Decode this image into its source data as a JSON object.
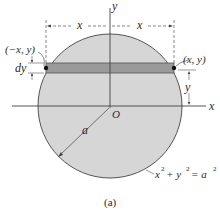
{
  "figure": {
    "caption": "(a)",
    "labels": {
      "y_axis": "y",
      "x_axis": "x",
      "origin": "O",
      "radius": "a",
      "left_dim": "x",
      "right_dim": "x",
      "left_point": "(−x, y)",
      "right_point": "(x, y)",
      "strip_height": "dy",
      "strip_y": "y",
      "equation_lhs": "x",
      "eq_plus": "+ y",
      "eq_rhs": "= a",
      "sup1": "2",
      "sup2": "2",
      "sup3": "2"
    },
    "colors": {
      "disk_fill": "#d6d6d6",
      "strip_fill": "#9a9a9a",
      "line": "#4a4a4a"
    }
  }
}
